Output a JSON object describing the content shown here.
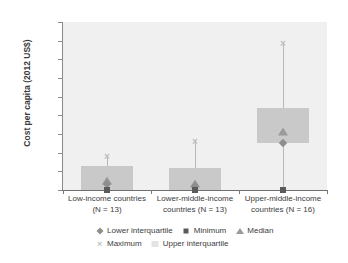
{
  "chart_data": {
    "type": "bar",
    "title": "",
    "xlabel": "",
    "ylabel": "Cost per capita (2012 US$)",
    "ylim": [
      0,
      0.9
    ],
    "ytick_labels": [
      "0.90",
      "0.80",
      "0.70",
      "0.60",
      "0.50",
      "0.40",
      "0.30",
      "0.20",
      "0.10",
      "0"
    ],
    "ytick_values": [
      0.9,
      0.8,
      0.7,
      0.6,
      0.5,
      0.4,
      0.3,
      0.2,
      0.1,
      0
    ],
    "grid": false,
    "legend_position": "bottom",
    "categories": [
      "Low-income countries (N = 13)",
      "Lower-middle-income countries (N = 13)",
      "Upper-middle-income countries (N = 16)"
    ],
    "category_lines": [
      [
        "Low-income countries",
        "(N = 13)"
      ],
      [
        "Lower-middle-income",
        "countries (N = 13)"
      ],
      [
        "Upper-middle-income",
        "countries (N = 16)"
      ]
    ],
    "series": [
      {
        "name": "Lower interquartile",
        "marker": "diamond",
        "color": "#8e8e8e",
        "values": [
          0.03,
          0.02,
          0.25
        ]
      },
      {
        "name": "Minimum",
        "marker": "square",
        "color": "#5a5a5a",
        "values": [
          0.0,
          0.0,
          0.0
        ]
      },
      {
        "name": "Median",
        "marker": "triangle",
        "color": "#9a9a9a",
        "values": [
          0.05,
          0.03,
          0.31
        ]
      },
      {
        "name": "Maximum",
        "marker": "cross",
        "color": "#bdbdbd",
        "values": [
          0.18,
          0.26,
          0.79
        ]
      },
      {
        "name": "Upper interquartile",
        "marker": "bar",
        "color": "#c9c9c9",
        "values": [
          0.13,
          0.12,
          0.44
        ]
      }
    ]
  },
  "legend": {
    "rows": [
      [
        {
          "label": "Lower interquartile",
          "marker": "diamond"
        },
        {
          "label": "Minimum",
          "marker": "square"
        },
        {
          "label": "Median",
          "marker": "triangle"
        }
      ],
      [
        {
          "label": "Maximum",
          "marker": "cross"
        },
        {
          "label": "Upper interquartile",
          "marker": "bar"
        }
      ]
    ]
  },
  "colors": {
    "plot_background": "#f0f0f0",
    "box_fill": "#c9c9c9",
    "whisker": "#b8b8b8",
    "axis": "#7a7a7a",
    "text": "#3d3d3d"
  }
}
